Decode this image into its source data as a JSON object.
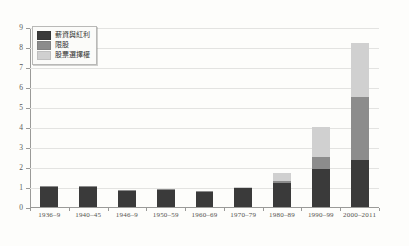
{
  "chart_data": {
    "type": "bar",
    "stacked": true,
    "title": "",
    "xlabel": "",
    "ylabel": "",
    "ylim": [
      0,
      9
    ],
    "yticks": [
      0,
      1,
      2,
      3,
      4,
      5,
      6,
      7,
      8,
      9
    ],
    "grid": true,
    "legend_position": "top-left",
    "categories": [
      "1936–9",
      "1940–45",
      "1946–9",
      "1950–59",
      "1960–69",
      "1970–79",
      "1980–89",
      "1990–99",
      "2000–2011"
    ],
    "series": [
      {
        "name": "薪資與紅利",
        "color": "#3a3a3a",
        "values": [
          1.02,
          1.03,
          0.82,
          0.88,
          0.78,
          0.95,
          1.18,
          1.9,
          2.33
        ]
      },
      {
        "name": "限股",
        "color": "#8c8c8c",
        "values": [
          0.04,
          0.03,
          0.02,
          0.02,
          0.02,
          0.05,
          0.12,
          0.6,
          3.17
        ]
      },
      {
        "name": "股票選擇權",
        "color": "#d0d0d0",
        "values": [
          0.0,
          0.0,
          0.0,
          0.0,
          0.0,
          0.02,
          0.38,
          1.5,
          2.7
        ]
      }
    ],
    "totals": [
      1.06,
      1.06,
      0.84,
      0.9,
      0.8,
      1.02,
      1.68,
      4.0,
      8.2
    ]
  },
  "legend": {
    "items": [
      {
        "label": "薪資與紅利",
        "color": "#3a3a3a"
      },
      {
        "label": "限股",
        "color": "#8c8c8c"
      },
      {
        "label": "股票選擇權",
        "color": "#d0d0d0"
      }
    ]
  },
  "page": {
    "title_faint": ""
  }
}
